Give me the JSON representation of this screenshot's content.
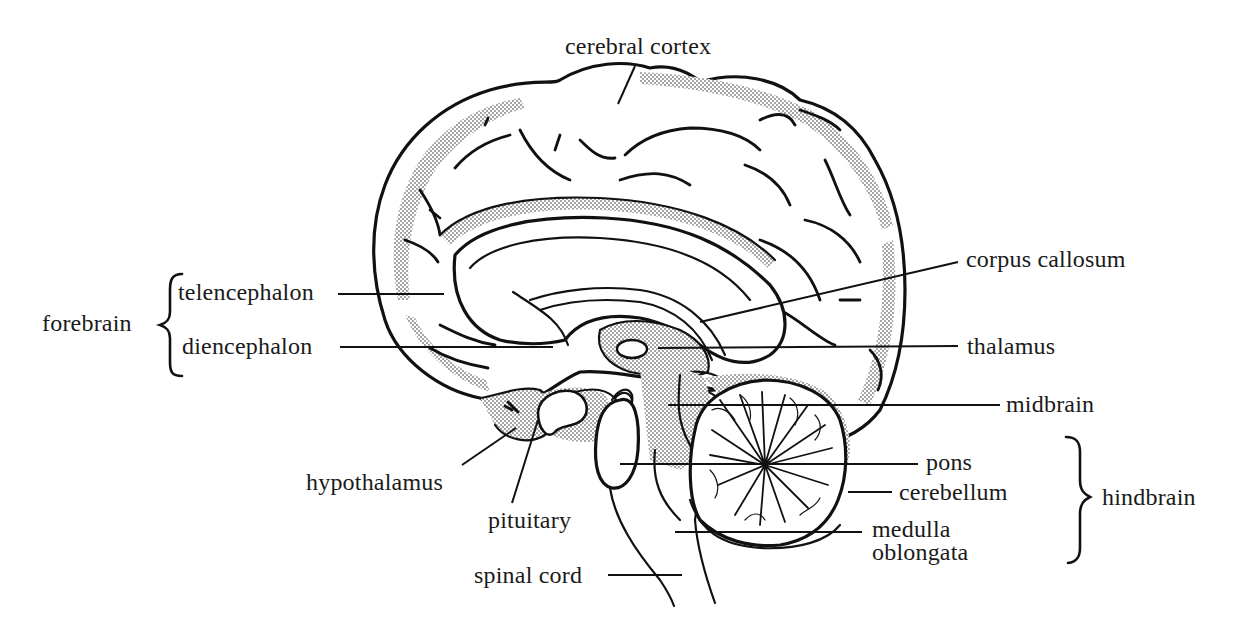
{
  "diagram": {
    "labels": {
      "cerebral_cortex": "cerebral cortex",
      "corpus_callosum": "corpus callosum",
      "thalamus": "thalamus",
      "midbrain": "midbrain",
      "pons": "pons",
      "cerebellum": "cerebellum",
      "medulla_line1": "medulla",
      "medulla_line2": "oblongata",
      "spinal_cord": "spinal cord",
      "pituitary": "pituitary",
      "hypothalamus": "hypothalamus",
      "telencephalon": "telencephalon",
      "diencephalon": "diencephalon"
    },
    "groups": {
      "forebrain": "forebrain",
      "hindbrain": "hindbrain"
    },
    "colors": {
      "ink": "#111111",
      "background": "#ffffff",
      "stipple": "#8a8a8a"
    }
  }
}
